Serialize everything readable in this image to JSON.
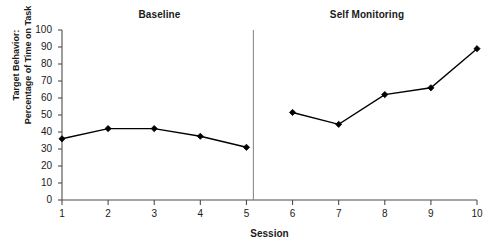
{
  "chart_data": {
    "type": "line",
    "title": "",
    "xlabel": "Session",
    "ylabel": "Target Behavior: Percentage of Time on Task",
    "ylabel_lines": [
      "Target Behavior:",
      "Percentage of Time on Task"
    ],
    "x": [
      1,
      2,
      3,
      4,
      5,
      6,
      7,
      8,
      9,
      10
    ],
    "xlim": [
      1,
      10
    ],
    "ylim": [
      0,
      100
    ],
    "xticks": [
      "1",
      "2",
      "3",
      "4",
      "5",
      "6",
      "7",
      "8",
      "9",
      "10"
    ],
    "yticks": [
      "0",
      "10",
      "20",
      "30",
      "40",
      "50",
      "60",
      "70",
      "80",
      "90",
      "100"
    ],
    "grid": false,
    "legend": "none",
    "marker": "diamond",
    "line_color": "#000000",
    "marker_color": "#000000",
    "axis_color": "#4d4d4d",
    "phase_divider_color": "#808080",
    "series": [
      {
        "name": "Baseline",
        "x": [
          1,
          2,
          3,
          4,
          5
        ],
        "values": [
          36,
          42,
          42,
          37.5,
          31
        ]
      },
      {
        "name": "Self Monitoring",
        "x": [
          6,
          7,
          8,
          9,
          10
        ],
        "values": [
          51.5,
          44.5,
          62,
          66,
          89
        ]
      }
    ],
    "phases": [
      {
        "label": "Baseline",
        "x_start": 1,
        "x_end": 5
      },
      {
        "label": "Self Monitoring",
        "x_start": 6,
        "x_end": 10
      }
    ],
    "phase_divider_x": 5.15,
    "annotations": []
  }
}
